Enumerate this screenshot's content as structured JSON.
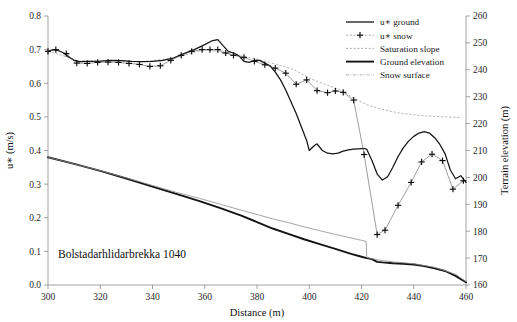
{
  "annotation": {
    "site_label": "Bolstadarhlidarbrekka 1040"
  },
  "axes": {
    "x": {
      "title": "Distance (m)",
      "ticks": [
        "300",
        "320",
        "340",
        "360",
        "380",
        "400",
        "420",
        "440",
        "460"
      ],
      "min": 300,
      "max": 460
    },
    "y_left": {
      "title": "u∗ (m/s)",
      "ticks": [
        "0.0",
        "0.1",
        "0.2",
        "0.3",
        "0.4",
        "0.5",
        "0.6",
        "0.7",
        "0.8"
      ],
      "min": 0.0,
      "max": 0.8
    },
    "y_right": {
      "title": "Terrain elevation (m)",
      "ticks": [
        "160",
        "170",
        "180",
        "190",
        "200",
        "210",
        "220",
        "230",
        "240",
        "250",
        "260"
      ],
      "min": 160,
      "max": 260
    }
  },
  "legend": {
    "items": [
      {
        "label": "u∗ ground",
        "style": "solid"
      },
      {
        "label": "u∗ snow",
        "style": "plus-marker"
      },
      {
        "label": "Saturation slope",
        "style": "dotted"
      },
      {
        "label": "Ground elevation",
        "style": "thick-solid"
      },
      {
        "label": "Snow surface",
        "style": "dash-dot"
      }
    ]
  },
  "chart_data": {
    "type": "line",
    "title": "Bolstadarhlidarbrekka 1040",
    "xlabel": "Distance (m)",
    "ylabel": "u∗ (m/s)",
    "ylabel_right": "Terrain elevation (m)",
    "xlim": [
      300,
      460
    ],
    "ylim": [
      0.0,
      0.8
    ],
    "ylim_right": [
      160,
      260
    ],
    "grid": false,
    "legend_position": "top-right",
    "series": [
      {
        "name": "u∗ ground",
        "axis": "left",
        "style": "solid-line",
        "x": [
          300,
          302,
          304,
          306,
          308,
          310,
          312,
          316,
          320,
          324,
          328,
          332,
          336,
          340,
          344,
          348,
          352,
          356,
          360,
          363,
          365,
          367,
          369,
          371,
          373,
          375,
          377,
          379,
          381,
          383,
          385,
          387,
          389,
          391,
          393,
          395,
          397,
          399,
          400,
          402,
          403,
          405,
          407,
          409,
          411,
          413,
          415,
          417,
          419,
          421,
          422,
          424,
          426,
          428,
          430,
          432,
          434,
          436,
          438,
          440,
          442,
          444,
          446,
          448,
          450,
          452,
          454,
          456,
          458,
          460
        ],
        "y": [
          0.695,
          0.7,
          0.697,
          0.69,
          0.678,
          0.668,
          0.664,
          0.665,
          0.666,
          0.668,
          0.667,
          0.665,
          0.664,
          0.665,
          0.668,
          0.675,
          0.688,
          0.7,
          0.715,
          0.727,
          0.73,
          0.712,
          0.695,
          0.69,
          0.682,
          0.665,
          0.662,
          0.668,
          0.668,
          0.66,
          0.652,
          0.633,
          0.61,
          0.58,
          0.545,
          0.51,
          0.47,
          0.43,
          0.4,
          0.415,
          0.42,
          0.4,
          0.392,
          0.39,
          0.392,
          0.398,
          0.402,
          0.404,
          0.405,
          0.406,
          0.404,
          0.37,
          0.33,
          0.312,
          0.322,
          0.35,
          0.382,
          0.408,
          0.428,
          0.442,
          0.452,
          0.456,
          0.452,
          0.438,
          0.418,
          0.39,
          0.342,
          0.316,
          0.325,
          0.305
        ]
      },
      {
        "name": "u∗ snow",
        "axis": "left",
        "style": "plus-markers",
        "x": [
          300,
          303,
          307,
          311,
          315,
          319,
          323,
          327,
          331,
          335,
          339,
          343,
          347,
          351,
          355,
          359,
          362,
          365,
          368,
          371,
          375,
          379,
          383,
          387,
          391,
          395,
          399,
          403,
          407,
          410,
          413,
          417,
          421,
          426,
          429,
          434,
          439,
          443,
          447,
          451,
          455,
          459
        ],
        "y": [
          0.695,
          0.7,
          0.688,
          0.66,
          0.659,
          0.662,
          0.663,
          0.662,
          0.659,
          0.656,
          0.65,
          0.652,
          0.668,
          0.683,
          0.695,
          0.7,
          0.7,
          0.7,
          0.69,
          0.683,
          0.677,
          0.665,
          0.655,
          0.645,
          0.63,
          0.597,
          0.61,
          0.578,
          0.572,
          0.577,
          0.573,
          0.55,
          0.388,
          0.15,
          0.163,
          0.237,
          0.305,
          0.366,
          0.389,
          0.37,
          0.285,
          0.31
        ]
      },
      {
        "name": "Ground elevation",
        "axis": "right",
        "style": "thick-solid-line",
        "x": [
          300,
          310,
          320,
          330,
          340,
          350,
          358,
          366,
          374,
          380,
          386,
          392,
          398,
          404,
          410,
          416,
          420,
          422,
          424,
          426,
          428,
          432,
          436,
          440,
          444,
          448,
          452,
          456,
          460
        ],
        "y": [
          207.5,
          205.0,
          202.4,
          199.6,
          196.6,
          193.6,
          191.2,
          188.6,
          185.8,
          183.4,
          181.0,
          179.0,
          177.0,
          175.2,
          173.4,
          171.6,
          170.5,
          170.0,
          169.6,
          168.6,
          168.4,
          168.1,
          167.9,
          167.6,
          167.0,
          166.2,
          165.2,
          163.4,
          161.0
        ]
      },
      {
        "name": "Snow surface",
        "axis": "right",
        "style": "thin-line",
        "x": [
          300,
          310,
          320,
          330,
          340,
          350,
          358,
          366,
          374,
          380,
          386,
          392,
          398,
          404,
          410,
          416,
          420,
          421.8,
          422,
          426,
          432,
          440,
          448,
          456,
          460
        ],
        "y": [
          207.5,
          205.0,
          202.5,
          199.8,
          197.0,
          194.2,
          192.2,
          190.0,
          187.8,
          186.2,
          184.6,
          183.2,
          181.6,
          180.2,
          178.8,
          177.5,
          176.6,
          176.2,
          170.2,
          169.4,
          168.6,
          167.9,
          166.6,
          164.0,
          161.2
        ]
      },
      {
        "name": "Saturation slope",
        "axis": "left",
        "style": "dotted-line",
        "x": [
          300,
          312,
          324,
          336,
          348,
          360,
          368,
          376,
          382,
          388,
          394,
          400,
          406,
          412,
          417,
          422,
          428,
          434,
          440,
          446,
          452,
          458
        ],
        "y": [
          0.696,
          0.666,
          0.667,
          0.664,
          0.675,
          0.7,
          0.69,
          0.678,
          0.668,
          0.655,
          0.641,
          0.615,
          0.597,
          0.58,
          0.556,
          0.536,
          0.522,
          0.512,
          0.506,
          0.502,
          0.5,
          0.498
        ]
      }
    ]
  }
}
